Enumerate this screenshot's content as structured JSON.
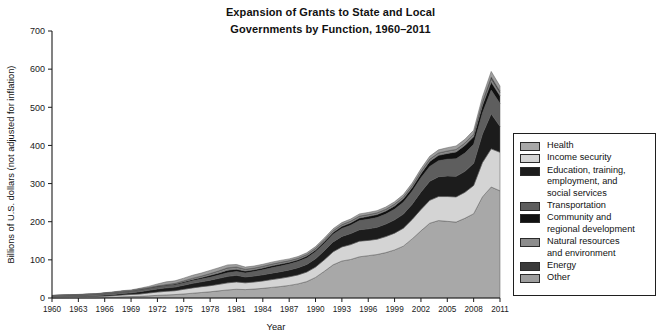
{
  "title": {
    "line1": "Expansion of Grants to State and Local",
    "line2": "Governments by Function, 1960–2011"
  },
  "axes": {
    "y_label": "Billions of U.S. dollars (not adjusted for inflation)",
    "x_label": "Year",
    "y_ticks": [
      "0",
      "100",
      "200",
      "300",
      "400",
      "500",
      "600",
      "700"
    ],
    "x_ticks": [
      "1960",
      "1963",
      "1966",
      "1969",
      "1972",
      "1975",
      "1978",
      "1981",
      "1984",
      "1987",
      "1990",
      "1993",
      "1996",
      "1999",
      "2002",
      "2005",
      "2008",
      "2011"
    ]
  },
  "legend": {
    "items": [
      {
        "label": "Health",
        "color": "#a8a8a8"
      },
      {
        "label": "Income security",
        "color": "#d4d4d4"
      },
      {
        "label": "Education, training,\nemployment, and\nsocial services",
        "color": "#1c1c1c"
      },
      {
        "label": "Transportation",
        "color": "#5e5e5e"
      },
      {
        "label": "Community and\nregional development",
        "color": "#111111"
      },
      {
        "label": "Natural resources\nand environment",
        "color": "#8c8c8c"
      },
      {
        "label": "Energy",
        "color": "#3a3a3a"
      },
      {
        "label": "Other",
        "color": "#9e9e9e"
      }
    ]
  },
  "chart_data": {
    "type": "area",
    "stacked": true,
    "title": "Expansion of Grants to State and Local Governments by Function, 1960–2011",
    "xlabel": "Year",
    "ylabel": "Billions of U.S. dollars (not adjusted for inflation)",
    "xlim": [
      1960,
      2011
    ],
    "ylim": [
      0,
      700
    ],
    "grid": false,
    "legend_position": "right",
    "x": [
      1960,
      1961,
      1962,
      1963,
      1964,
      1965,
      1966,
      1967,
      1968,
      1969,
      1970,
      1971,
      1972,
      1973,
      1974,
      1975,
      1976,
      1977,
      1978,
      1979,
      1980,
      1981,
      1982,
      1983,
      1984,
      1985,
      1986,
      1987,
      1988,
      1989,
      1990,
      1991,
      1992,
      1993,
      1994,
      1995,
      1996,
      1997,
      1998,
      1999,
      2000,
      2001,
      2002,
      2003,
      2004,
      2005,
      2006,
      2007,
      2008,
      2009,
      2010,
      2011
    ],
    "series": [
      {
        "name": "Health",
        "color": "#a8a8a8",
        "values": [
          0.2,
          0.3,
          0.4,
          0.5,
          0.6,
          0.6,
          1.2,
          2.0,
          3.2,
          3.8,
          4.3,
          5.6,
          7.0,
          8.0,
          9.0,
          10.6,
          12.5,
          14.4,
          16.3,
          18.8,
          21.2,
          22.9,
          22.0,
          23.5,
          25.3,
          27.8,
          30.0,
          33.0,
          37.0,
          43.0,
          54.0,
          70.0,
          87.0,
          97.0,
          101.0,
          108.0,
          111.0,
          114.0,
          119.0,
          126.0,
          136.0,
          155.0,
          176.0,
          196.0,
          203.0,
          201.0,
          199.0,
          209.0,
          221.0,
          265.0,
          291.0,
          281.0
        ]
      },
      {
        "name": "Income security",
        "color": "#d4d4d4",
        "values": [
          2.6,
          2.8,
          2.9,
          3.1,
          3.3,
          3.5,
          3.7,
          4.0,
          4.7,
          5.4,
          6.0,
          7.5,
          8.6,
          9.6,
          10.1,
          12.2,
          14.0,
          15.2,
          16.0,
          17.0,
          18.5,
          19.2,
          17.8,
          18.4,
          19.4,
          20.4,
          21.5,
          22.5,
          23.5,
          25.0,
          27.0,
          30.0,
          34.0,
          37.0,
          39.0,
          41.0,
          40.0,
          40.0,
          42.0,
          44.0,
          47.0,
          51.0,
          56.0,
          60.0,
          63.0,
          65.0,
          66.0,
          68.0,
          74.0,
          90.0,
          100.0,
          101.0
        ]
      },
      {
        "name": "Education, training, employment, and social services",
        "color": "#1c1c1c",
        "values": [
          0.5,
          0.6,
          0.8,
          1.0,
          1.2,
          1.5,
          2.9,
          3.5,
          4.1,
          4.4,
          6.4,
          7.0,
          8.2,
          9.0,
          9.5,
          10.8,
          12.0,
          13.0,
          14.5,
          16.0,
          17.0,
          17.5,
          15.5,
          15.8,
          16.2,
          17.0,
          17.5,
          18.0,
          19.0,
          20.0,
          22.0,
          24.0,
          26.0,
          27.5,
          29.0,
          30.0,
          30.5,
          31.5,
          33.0,
          35.0,
          37.0,
          40.0,
          46.0,
          50.0,
          52.0,
          54.0,
          54.0,
          55.0,
          58.0,
          75.0,
          92.0,
          68.0
        ]
      },
      {
        "name": "Transportation",
        "color": "#5e5e5e",
        "values": [
          3.0,
          3.2,
          3.3,
          3.6,
          4.0,
          4.1,
          4.1,
          4.2,
          4.3,
          4.4,
          4.6,
          4.8,
          5.1,
          5.2,
          5.4,
          5.9,
          6.8,
          7.1,
          7.6,
          8.5,
          9.8,
          10.0,
          10.5,
          11.5,
          13.0,
          14.0,
          15.0,
          15.5,
          16.0,
          17.0,
          18.0,
          19.0,
          20.0,
          21.0,
          22.0,
          24.0,
          25.0,
          25.5,
          26.0,
          28.0,
          31.0,
          34.0,
          37.0,
          39.0,
          42.0,
          44.0,
          46.0,
          48.0,
          50.0,
          55.0,
          62.0,
          60.0
        ]
      },
      {
        "name": "Community and regional development",
        "color": "#111111",
        "values": [
          0.1,
          0.2,
          0.2,
          0.3,
          0.4,
          0.5,
          0.6,
          0.7,
          0.9,
          1.0,
          1.8,
          2.0,
          2.3,
          2.6,
          2.9,
          3.0,
          3.5,
          4.0,
          5.0,
          5.5,
          6.5,
          6.0,
          5.0,
          4.8,
          5.0,
          5.2,
          5.0,
          4.8,
          4.6,
          4.8,
          5.0,
          5.0,
          5.2,
          5.4,
          6.0,
          7.0,
          7.5,
          7.8,
          8.0,
          8.5,
          9.0,
          9.5,
          11.0,
          13.0,
          14.0,
          15.0,
          18.0,
          20.0,
          20.0,
          20.0,
          21.0,
          20.0
        ]
      },
      {
        "name": "Natural resources and environment",
        "color": "#8c8c8c",
        "values": [
          0.1,
          0.1,
          0.2,
          0.2,
          0.2,
          0.2,
          0.3,
          0.4,
          0.4,
          0.4,
          0.4,
          0.5,
          0.6,
          0.8,
          1.5,
          2.4,
          3.0,
          3.5,
          4.2,
          4.8,
          5.4,
          5.0,
          4.2,
          4.1,
          4.0,
          4.0,
          4.1,
          3.8,
          3.7,
          3.8,
          3.8,
          3.9,
          4.0,
          4.1,
          4.2,
          4.3,
          4.2,
          4.2,
          4.3,
          4.4,
          4.5,
          4.8,
          5.2,
          5.5,
          5.8,
          6.0,
          6.0,
          5.8,
          5.9,
          7.0,
          8.0,
          7.5
        ]
      },
      {
        "name": "Energy",
        "color": "#3a3a3a",
        "values": [
          0.0,
          0.0,
          0.0,
          0.0,
          0.0,
          0.0,
          0.0,
          0.0,
          0.0,
          0.0,
          0.0,
          0.0,
          0.0,
          0.1,
          0.1,
          0.2,
          0.3,
          0.4,
          0.6,
          0.8,
          0.9,
          0.8,
          0.6,
          0.5,
          0.5,
          0.5,
          0.5,
          0.4,
          0.4,
          0.4,
          0.4,
          0.4,
          0.4,
          0.5,
          0.5,
          0.5,
          0.5,
          0.4,
          0.4,
          0.4,
          0.4,
          0.4,
          0.5,
          0.6,
          0.6,
          0.6,
          0.6,
          0.6,
          0.7,
          3.0,
          6.0,
          5.0
        ]
      },
      {
        "name": "Other",
        "color": "#9e9e9e",
        "values": [
          0.5,
          0.6,
          0.7,
          0.8,
          0.9,
          1.0,
          1.1,
          1.3,
          1.6,
          1.8,
          2.0,
          3.0,
          5.0,
          7.0,
          6.5,
          7.0,
          7.5,
          7.8,
          8.2,
          8.0,
          7.5,
          6.5,
          5.5,
          5.2,
          5.0,
          5.0,
          5.0,
          4.5,
          4.4,
          4.5,
          4.6,
          4.8,
          5.0,
          5.2,
          5.4,
          5.6,
          5.5,
          5.6,
          5.8,
          6.0,
          6.2,
          6.5,
          7.0,
          7.5,
          8.0,
          8.5,
          9.0,
          9.5,
          10.0,
          12.0,
          14.0,
          13.0
        ]
      }
    ]
  }
}
